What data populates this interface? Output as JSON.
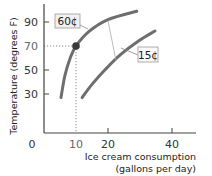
{
  "chart_data": {
    "type": "line",
    "title": "",
    "xlabel_lines": [
      "Ice cream consumption",
      "(gallons per day)"
    ],
    "ylabel": "Temperature (degrees F)",
    "xlim": [
      0,
      45
    ],
    "ylim": [
      0,
      100
    ],
    "x_ticks": [
      {
        "value": 0,
        "label": "0"
      },
      {
        "value": 10,
        "label": "10",
        "highlight": true
      },
      {
        "value": 20,
        "label": "20"
      },
      {
        "value": 40,
        "label": "40"
      }
    ],
    "y_ticks": [
      {
        "value": 30,
        "label": "30"
      },
      {
        "value": 50,
        "label": "50"
      },
      {
        "value": 70,
        "label": "70",
        "highlight": true
      },
      {
        "value": 90,
        "label": "90"
      }
    ],
    "grid": false,
    "series": [
      {
        "name": "60¢",
        "label": "60¢",
        "color": "#6e6e6e",
        "points": [
          [
            5.3,
            27
          ],
          [
            6.5,
            45
          ],
          [
            8.2,
            60
          ],
          [
            10,
            70
          ],
          [
            14,
            82
          ],
          [
            20,
            92
          ],
          [
            29,
            99
          ]
        ]
      },
      {
        "name": "15¢",
        "label": "15¢",
        "color": "#6e6e6e",
        "points": [
          [
            11.9,
            27
          ],
          [
            15,
            38
          ],
          [
            19,
            50
          ],
          [
            24,
            63
          ],
          [
            30,
            75
          ],
          [
            34.7,
            82.5
          ]
        ]
      }
    ],
    "highlight_point": {
      "x": 10,
      "y": 70,
      "color": "#3a3a3a"
    },
    "annotations": [
      {
        "text": "60¢",
        "series": 0
      },
      {
        "text": "15¢",
        "series": 1
      }
    ]
  }
}
